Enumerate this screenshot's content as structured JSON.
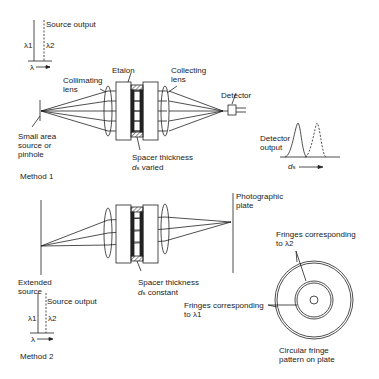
{
  "method1": {
    "title": "Method 1",
    "source_spectrum": {
      "label": "Source output",
      "lambda1": "λ1",
      "lambda2": "λ2",
      "axis": "λ"
    },
    "labels": {
      "collimating_lens": "Collimating\nlens",
      "etalon": "Etalon",
      "collecting_lens": "Collecting\nlens",
      "detector": "Detector",
      "source": "Small area\nsource or\npinhole",
      "spacer": "Spacer thickness",
      "spacer_var": "d",
      "spacer_sub": "s",
      "spacer_state": "varied",
      "detector_output": "Detector\noutput",
      "axis_var": "d",
      "axis_sub": "s"
    }
  },
  "method2": {
    "title": "Method 2",
    "source_spectrum": {
      "label": "Source output",
      "lambda1": "λ1",
      "lambda2": "λ2",
      "axis": "λ"
    },
    "labels": {
      "plate": "Photographic\nplate",
      "source": "Extended\nsource",
      "spacer": "Spacer thickness",
      "spacer_var": "d",
      "spacer_sub": "s",
      "spacer_state": "constant",
      "fringes_l2": "Fringes corresponding\nto λ2",
      "fringes_l1": "Fringes corresponding\nto λ1",
      "pattern": "Circular fringe\npattern on plate"
    }
  },
  "colors": {
    "ink": "#222222",
    "background": "#ffffff"
  }
}
